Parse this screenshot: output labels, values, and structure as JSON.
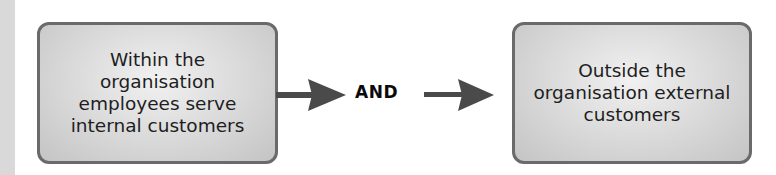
{
  "diagram": {
    "type": "flow",
    "nodes": [
      {
        "id": "internal",
        "label": "Within the\norganisation\nemployees serve\ninternal customers"
      },
      {
        "id": "external",
        "label": "Outside the\norganisation external\ncustomers"
      }
    ],
    "connector": {
      "label": "AND"
    },
    "edges": [
      {
        "from": "internal",
        "to": "connector"
      },
      {
        "from": "connector",
        "to": "external"
      }
    ],
    "colors": {
      "box_fill": "#d6d6d6",
      "box_border": "#6a6a6a",
      "arrow": "#4a4a4a",
      "text": "#1e1e1e"
    }
  }
}
